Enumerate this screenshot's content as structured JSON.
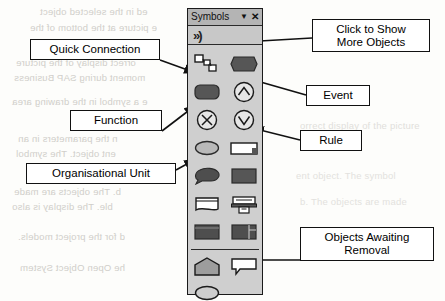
{
  "panel": {
    "title": "Symbols",
    "dropdown_icon": "chevron-down-icon",
    "close_icon": "close-icon",
    "more_objects_icon": "double-chevron-right-icon",
    "separator": "toolbar-separator",
    "symbols": [
      {
        "name": "quick-connection",
        "icon": "connected-squares-icon"
      },
      {
        "name": "event",
        "icon": "hexagon-filled-icon"
      },
      {
        "name": "function",
        "icon": "rounded-rect-filled-icon"
      },
      {
        "name": "connector-and",
        "icon": "circle-caret-up-icon"
      },
      {
        "name": "connector-xor",
        "icon": "circle-x-icon"
      },
      {
        "name": "rule",
        "icon": "circle-caret-down-icon"
      },
      {
        "name": "organisational-unit",
        "icon": "ellipse-filled-icon"
      },
      {
        "name": "information-object",
        "icon": "outlined-bar-icon"
      },
      {
        "name": "cluster",
        "icon": "cloud-filled-icon"
      },
      {
        "name": "entity-type",
        "icon": "rect-filled-icon"
      },
      {
        "name": "document",
        "icon": "document-outline-icon"
      },
      {
        "name": "output-device",
        "icon": "printer-icon"
      },
      {
        "name": "application-system",
        "icon": "rect-dark-icon"
      },
      {
        "name": "screen-object",
        "icon": "rect-split-icon"
      }
    ],
    "pending_symbols": [
      {
        "name": "pending-home",
        "icon": "pentagon-outline-icon"
      },
      {
        "name": "pending-note",
        "icon": "speech-callout-icon"
      },
      {
        "name": "pending-ellipse",
        "icon": "ellipse-outline-icon"
      }
    ]
  },
  "callouts": {
    "quick_connection": {
      "lines": [
        "Quick Connection"
      ]
    },
    "function": {
      "lines": [
        "Function"
      ]
    },
    "organisational_unit": {
      "lines": [
        "Organisational Unit"
      ]
    },
    "click_to_show": {
      "lines": [
        "Click to Show",
        "More Objects"
      ]
    },
    "event": {
      "lines": [
        "Event"
      ]
    },
    "rule": {
      "lines": [
        "Rule"
      ]
    },
    "objects_awaiting_removal": {
      "lines": [
        "Objects Awaiting",
        "Removal"
      ]
    }
  },
  "background_ghost_text": [
    "ed in the selected object",
    "e picture at the bottom of the",
    "orrect display of the picture",
    "moment during SAP Business",
    "e a symbol in the drawing area",
    "n the parameters in an",
    "ent object. The symbol",
    "b. The objects are made",
    "ble. The display is also",
    "d for the project models.",
    "he Open Object System"
  ],
  "colors": {
    "panel_background": "#cfcfcf",
    "titlebar": "#b4b4b4",
    "morebar": "#c8c8c8",
    "symbol_fill": "#565656",
    "symbol_light": "#c4c4c4",
    "outline": "#1a1a1a",
    "page": "#fdfdfb",
    "ghost": "#c9c7c2"
  }
}
